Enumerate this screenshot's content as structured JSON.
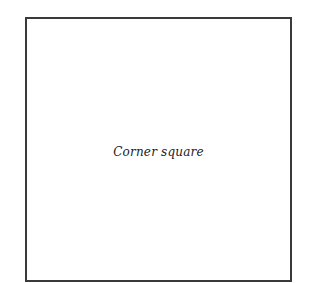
{
  "diagram": {
    "shape": "square",
    "label": "Corner square",
    "border_color": "#3a3a3a",
    "background_color": "#ffffff"
  }
}
